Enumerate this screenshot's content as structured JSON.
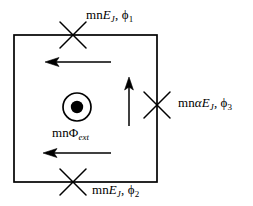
{
  "figure": {
    "type": "circuit-diagram",
    "background_color": "#ffffff",
    "stroke_color": "#000000",
    "loop": {
      "name": "superconducting-loop",
      "x": 14,
      "y": 35,
      "width": 143,
      "height": 147,
      "stroke_width": 1.6
    },
    "junctions": [
      {
        "id": "junction-top",
        "cx": 73,
        "cy": 35,
        "arm": 17,
        "label_ref": "labels.top"
      },
      {
        "id": "junction-right",
        "cx": 157,
        "cy": 105,
        "arm": 17,
        "label_ref": "labels.right"
      },
      {
        "id": "junction-bottom",
        "cx": 73,
        "cy": 182,
        "arm": 17,
        "label_ref": "labels.bottom"
      }
    ],
    "flux_symbol": {
      "name": "flux-out-of-page",
      "cx": 77,
      "cy": 107,
      "outer_radius": 14,
      "inner_radius": 6.2,
      "label_ref": "labels.flux"
    },
    "current_arrows": [
      {
        "id": "arrow-top-left",
        "direction": "left",
        "x1": 111,
        "y1": 62,
        "x2": 45,
        "y2": 62
      },
      {
        "id": "arrow-bottom-left",
        "direction": "left",
        "x1": 111,
        "y1": 153,
        "x2": 43,
        "y2": 153
      },
      {
        "id": "arrow-right-up",
        "direction": "up",
        "x1": 129,
        "y1": 126,
        "x2": 129,
        "y2": 77
      }
    ]
  },
  "labels": {
    "top": {
      "id": "label-top",
      "text": "mnE_J, ϕ₁",
      "parts": [
        {
          "t": "mn",
          "style": "roman"
        },
        {
          "t": "E",
          "style": "italic"
        },
        {
          "t": "J",
          "style": "sub-italic"
        },
        {
          "t": ", ",
          "style": "roman"
        },
        {
          "t": "ϕ",
          "style": "greek"
        },
        {
          "t": "1",
          "style": "sub-roman"
        }
      ]
    },
    "right": {
      "id": "label-right",
      "text": "mnαE_J, ϕ₃",
      "parts": [
        {
          "t": "mn",
          "style": "roman"
        },
        {
          "t": "α",
          "style": "greek-italic"
        },
        {
          "t": "E",
          "style": "italic"
        },
        {
          "t": "J",
          "style": "sub-italic"
        },
        {
          "t": ", ",
          "style": "roman"
        },
        {
          "t": "ϕ",
          "style": "greek"
        },
        {
          "t": "3",
          "style": "sub-roman"
        }
      ]
    },
    "bottom": {
      "id": "label-bottom",
      "text": "mnE_J, ϕ₂",
      "parts": [
        {
          "t": "mn",
          "style": "roman"
        },
        {
          "t": "E",
          "style": "italic"
        },
        {
          "t": "J",
          "style": "sub-italic"
        },
        {
          "t": ", ",
          "style": "roman"
        },
        {
          "t": "ϕ",
          "style": "greek"
        },
        {
          "t": "2",
          "style": "sub-roman"
        }
      ]
    },
    "flux": {
      "id": "label-flux",
      "text": "mnΦ_ext",
      "parts": [
        {
          "t": "mn",
          "style": "roman"
        },
        {
          "t": "Φ",
          "style": "greek"
        },
        {
          "t": "ext",
          "style": "sub-italic"
        }
      ]
    }
  }
}
